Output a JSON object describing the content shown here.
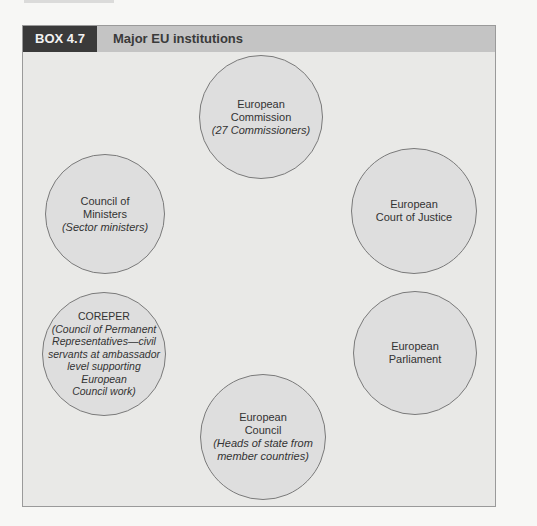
{
  "box": {
    "tab_label": "BOX 4.7",
    "title": "Major EU institutions",
    "colors": {
      "tab": "#3a3a3a",
      "header": "#c4c4c4",
      "panel": "#e9e9e7",
      "circle": "#dedede"
    }
  },
  "institutions": [
    {
      "name_lines": [
        "European",
        "Commission"
      ],
      "note_lines": [
        "(27 Commissioners)"
      ]
    },
    {
      "name_lines": [
        "Council of",
        "Ministers"
      ],
      "note_lines": [
        "(Sector ministers)"
      ]
    },
    {
      "name_lines": [
        "European",
        "Court of Justice"
      ],
      "note_lines": []
    },
    {
      "name_lines": [
        "COREPER"
      ],
      "note_lines": [
        "(Council of Permanent",
        "Representatives—civil",
        "servants at ambassador",
        "level supporting",
        "European",
        "Council work)"
      ]
    },
    {
      "name_lines": [
        "European",
        "Parliament"
      ],
      "note_lines": []
    },
    {
      "name_lines": [
        "European",
        "Council"
      ],
      "note_lines": [
        "(Heads of state from",
        "member countries)"
      ]
    }
  ]
}
